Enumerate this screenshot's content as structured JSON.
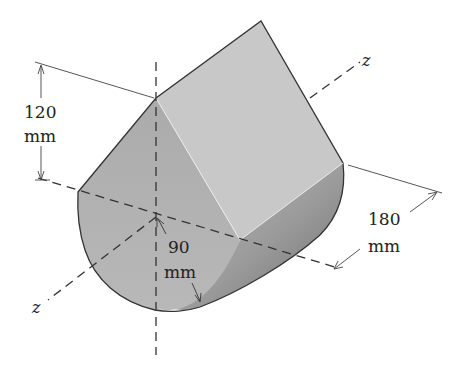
{
  "figure": {
    "type": "isometric-solid",
    "colors": {
      "front_face": "#b3b3b3",
      "top_face": "#c9c9c9",
      "side_face_light": "#bdbdbd",
      "side_face_dark": "#7a7a7a",
      "outline": "#333333",
      "axis_line": "#333333"
    }
  },
  "dimensions": {
    "height": {
      "value": "120",
      "unit": "mm"
    },
    "length": {
      "value": "180",
      "unit": "mm"
    },
    "radius": {
      "value": "90",
      "unit": "mm"
    }
  },
  "axes": {
    "z_upper": "z",
    "z_lower": "z"
  }
}
